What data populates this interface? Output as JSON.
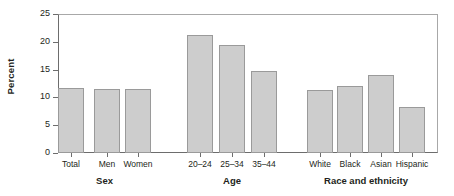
{
  "chart_data": {
    "type": "bar",
    "title": "",
    "xlabel": "",
    "ylabel": "Percent",
    "ylim": [
      0,
      25
    ],
    "yticks": [
      0,
      5,
      10,
      15,
      20,
      25
    ],
    "ytick_labels": [
      "0",
      "5",
      "10",
      "15",
      "20",
      "25"
    ],
    "grid": false,
    "legend": "none",
    "bar_fill_color": "#cdcdcd",
    "bar_edge_color": "#9a9a9a",
    "axis_color": "#6d6d6d",
    "text_color": "#231f20",
    "categories": [
      "Total",
      "Men",
      "Women",
      "20–24",
      "25–34",
      "35–44",
      "White",
      "Black",
      "Asian",
      "Hispanic"
    ],
    "values": [
      11.7,
      11.6,
      11.5,
      21.2,
      19.5,
      14.7,
      11.4,
      12.1,
      14.1,
      8.3
    ],
    "groups": [
      {
        "label": "Sex",
        "categories": [
          "Total",
          "Men",
          "Women"
        ]
      },
      {
        "label": "Age",
        "categories": [
          "20–24",
          "25–34",
          "35–44"
        ]
      },
      {
        "label": "Race and ethnicity",
        "categories": [
          "White",
          "Black",
          "Asian",
          "Hispanic"
        ]
      }
    ],
    "group_labels": [
      "Sex",
      "Age",
      "Race and ethnicity"
    ]
  }
}
